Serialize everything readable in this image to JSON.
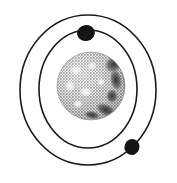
{
  "figure": {
    "title": "Atom orbit diagram",
    "width": 177,
    "height": 183,
    "background_color": "#ffffff"
  },
  "colors": {
    "background": "#ffffff",
    "orbit_stroke": "#1a1a1a",
    "electron_fill": "#141414",
    "nucleus_light": "#f2f2f2",
    "nucleus_mid": "#b9b9b9",
    "nucleus_dark": "#4a4a4a",
    "nucleus_shadow": "#2b2b2b",
    "nucleus_outline": "#8a8a8a"
  },
  "nucleus": {
    "label": "nucleus-sphere",
    "cx": 91,
    "cy": 86,
    "r": 34,
    "highlight_spots": [
      {
        "cx": 76,
        "cy": 70,
        "rx": 6,
        "ry": 5
      },
      {
        "cx": 92,
        "cy": 66,
        "rx": 5,
        "ry": 4
      },
      {
        "cx": 70,
        "cy": 86,
        "rx": 5,
        "ry": 6
      },
      {
        "cx": 86,
        "cy": 92,
        "rx": 7,
        "ry": 5
      },
      {
        "cx": 101,
        "cy": 82,
        "rx": 4,
        "ry": 4
      },
      {
        "cx": 78,
        "cy": 104,
        "rx": 5,
        "ry": 4
      }
    ],
    "dark_patches": [
      {
        "cx": 114,
        "cy": 64,
        "rx": 10,
        "ry": 8,
        "rot": -35
      },
      {
        "cx": 116,
        "cy": 80,
        "rx": 6,
        "ry": 11,
        "rot": -10
      },
      {
        "cx": 106,
        "cy": 110,
        "rx": 11,
        "ry": 6,
        "rot": 25
      },
      {
        "cx": 92,
        "cy": 115,
        "rx": 8,
        "ry": 4,
        "rot": 10
      },
      {
        "cx": 112,
        "cy": 96,
        "rx": 6,
        "ry": 7,
        "rot": 0
      }
    ]
  },
  "orbits": [
    {
      "name": "inner-orbit",
      "label": "Inner orbit",
      "cx": 88,
      "cy": 89,
      "rx": 49,
      "ry": 59,
      "stroke_width": 1.6
    },
    {
      "name": "outer-orbit",
      "label": "Outer orbit",
      "cx": 88,
      "cy": 90,
      "rx": 68,
      "ry": 75,
      "stroke_width": 1.6
    }
  ],
  "electrons": [
    {
      "name": "electron-top",
      "label": "Electron on inner orbit",
      "cx": 86,
      "cy": 33,
      "rx": 9,
      "ry": 8,
      "rot": -12,
      "orbit": "inner-orbit"
    },
    {
      "name": "electron-bottom-right",
      "label": "Electron on outer orbit",
      "cx": 132,
      "cy": 147,
      "rx": 7.5,
      "ry": 8,
      "rot": 20,
      "orbit": "outer-orbit"
    }
  ]
}
